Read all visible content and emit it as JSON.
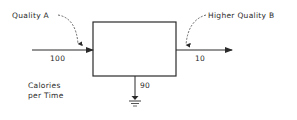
{
  "diagram": {
    "input": {
      "label": "Quality A",
      "value": "100"
    },
    "output": {
      "label": "Higher Quality B",
      "value": "10"
    },
    "heat_sink": {
      "value": "90"
    },
    "units": {
      "line1": "Calories",
      "line2": "per Time"
    },
    "colors": {
      "stroke": "#2a2a2a",
      "background": "#ffffff"
    }
  }
}
